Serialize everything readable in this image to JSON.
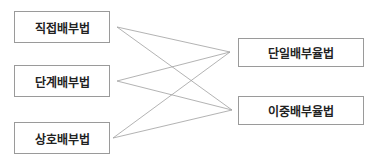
{
  "left_nodes": [
    {
      "label": "직접배부법"
    },
    {
      "label": "단계배부법"
    },
    {
      "label": "상호배부법"
    }
  ],
  "right_nodes": [
    {
      "label": "단일배부율법"
    },
    {
      "label": "이중배부율법"
    }
  ],
  "connections": [
    [
      "직접배부법",
      "단일배부율법"
    ],
    [
      "직접배부법",
      "이중배부율법"
    ],
    [
      "단계배부법",
      "단일배부율법"
    ],
    [
      "단계배부법",
      "이중배부율법"
    ],
    [
      "상호배부법",
      "단일배부율법"
    ],
    [
      "상호배부법",
      "이중배부율법"
    ]
  ],
  "colors": {
    "line": "#a0a0a0",
    "border": "#9a9a9a"
  }
}
